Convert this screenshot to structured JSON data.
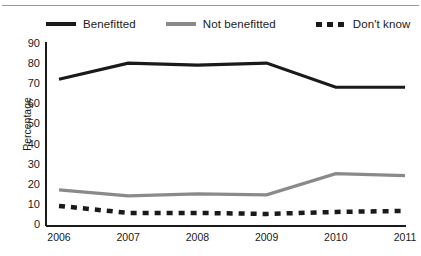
{
  "figure": {
    "clipped_title_remnant": "Figure: Perceived benefit from the programme",
    "ylabel": "Percentage"
  },
  "legend": {
    "position": "top",
    "items": [
      {
        "label": "Benefitted",
        "style": "solid",
        "color": "#1a1a1a",
        "swatch": "solid-black"
      },
      {
        "label": "Not benefitted",
        "style": "solid",
        "color": "#8a8a8a",
        "swatch": "solid-grey"
      },
      {
        "label": "Don't know",
        "style": "dashed",
        "color": "#1a1a1a",
        "swatch": "dashed-black"
      }
    ]
  },
  "chart_data": {
    "type": "line",
    "title": "",
    "xlabel": "",
    "ylabel": "Percentage",
    "categories": [
      "2006",
      "2007",
      "2008",
      "2009",
      "2010",
      "2011"
    ],
    "yticks": [
      0,
      10,
      20,
      30,
      40,
      50,
      60,
      70,
      80,
      90
    ],
    "ylim": [
      0,
      90
    ],
    "grid": false,
    "legend_position": "top",
    "series": [
      {
        "name": "Benefitted",
        "color": "#1a1a1a",
        "style": "solid",
        "values": [
          73,
          81,
          80,
          81,
          69,
          69
        ]
      },
      {
        "name": "Not benefitted",
        "color": "#8a8a8a",
        "style": "solid",
        "values": [
          18,
          15,
          16,
          15.5,
          26,
          25
        ]
      },
      {
        "name": "Don't know",
        "color": "#1a1a1a",
        "style": "dashed",
        "values": [
          10,
          6.5,
          6.5,
          6,
          7,
          7.5
        ]
      }
    ]
  }
}
